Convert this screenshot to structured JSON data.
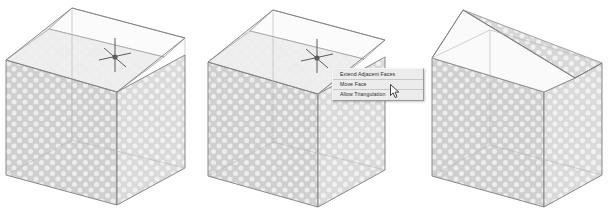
{
  "scene": {
    "title": "Move Face operation on solid box",
    "background_color": "#ffffff"
  },
  "colors": {
    "face_dark": "#c9c9c9",
    "face_mid": "#d7d7d7",
    "face_light": "#f2f2f2",
    "face_highlight": "#fbfbfb",
    "edge": "#7b7b7b",
    "edge_soft": "#a8a8a8",
    "menu_bg": "#ececec",
    "menu_border": "#9a9a9a",
    "menu_text": "#2a2a2a",
    "cursor": "#4a4a4a"
  },
  "panels": [
    {
      "id": "panel-1",
      "name": "box-before-selection",
      "caption": "",
      "has_crosshair": true,
      "has_menu": false,
      "shape": "rectangular-box-with-selected-top-strip"
    },
    {
      "id": "panel-2",
      "name": "box-with-context-menu",
      "caption": "",
      "has_crosshair": true,
      "has_menu": true,
      "shape": "rectangular-box-with-selected-top-strip"
    },
    {
      "id": "panel-3",
      "name": "box-after-face-move",
      "caption": "",
      "has_crosshair": false,
      "has_menu": false,
      "shape": "box-with-raised-ridge-roof"
    }
  ],
  "context_menu": {
    "name": "face-options-context-menu",
    "items": [
      {
        "label": "Extend Adjacent Faces",
        "enabled": true,
        "checked": false
      },
      {
        "label": "Move Face",
        "enabled": true,
        "checked": false
      },
      {
        "label": "Allow Triangulation",
        "enabled": true,
        "checked": false
      }
    ]
  },
  "cursors": {
    "crosshair_label": "crosshair-snap-cursor",
    "arrow_label": "arrow-pointer-cursor"
  }
}
